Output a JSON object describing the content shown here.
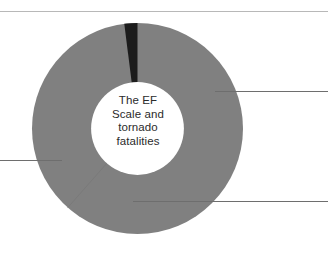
{
  "figure": {
    "name": "donut-chart-figure",
    "background_color": "#ffffff",
    "top_rule_color": "#b8b8b8",
    "leader_line_color": "#6e6e6e"
  },
  "center_label": {
    "text": "The EF\nScale and\ntornado\nfatalities",
    "lines": [
      "The EF",
      "Scale and",
      "tornado",
      "fatalities"
    ],
    "color": "#2b2b2b"
  },
  "chart_data": {
    "type": "pie",
    "title": "The EF Scale and tornado fatalities",
    "subtitle": "",
    "xlabel": "",
    "ylabel": "",
    "donut": true,
    "inner_radius_ratio": 0.44,
    "legend_position": "none",
    "grid": false,
    "annotations": [
      {
        "name": "leader-line-right",
        "y": 91,
        "from_x": 215,
        "to_x": 328
      },
      {
        "name": "leader-line-left",
        "y": 160,
        "from_x": 0,
        "to_x": 62
      },
      {
        "name": "leader-line-bottom",
        "y": 201,
        "from_x": 133,
        "to_x": 328
      }
    ],
    "labels": [
      "Large gray segment",
      "Second gray segment",
      "Dark narrow segment"
    ],
    "values": [
      61.5,
      36.5,
      2.0
    ],
    "colors": [
      "#808080",
      "#7f7f7f",
      "#1c1c1c"
    ],
    "start_angle_deg": 0,
    "segments": [
      {
        "label": "Large gray segment",
        "value": 61.5,
        "color": "#808080",
        "start_deg": 0,
        "end_deg": 221.4
      },
      {
        "label": "Second gray segment",
        "value": 36.5,
        "color": "#7f7f7f",
        "start_deg": 221.4,
        "end_deg": 352.8
      },
      {
        "label": "Dark narrow segment",
        "value": 2.0,
        "color": "#1c1c1c",
        "start_deg": 352.8,
        "end_deg": 360
      }
    ]
  }
}
